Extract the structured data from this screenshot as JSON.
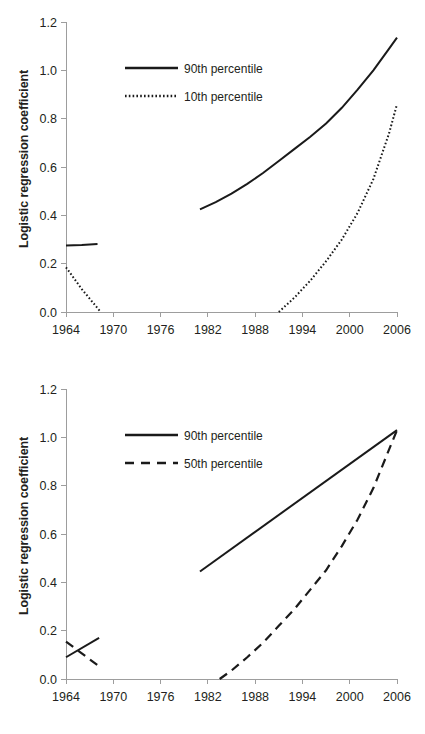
{
  "figure": {
    "background_color": "#ffffff",
    "line_color": "#1a1a1a",
    "axis_color": "#9d9d9d",
    "text_color": "#231f20"
  },
  "panels": [
    {
      "id": "top",
      "ylabel": "Logistic regression coefficient",
      "yticks": [
        "1.2",
        "1.0",
        "0.8",
        "0.6",
        "0.4",
        "0.2",
        "0.0"
      ],
      "xticks": [
        "1964",
        "1970",
        "1976",
        "1982",
        "1988",
        "1994",
        "2000",
        "2006"
      ],
      "legend": [
        {
          "label": "90th percentile",
          "style": "solid"
        },
        {
          "label": "10th percentile",
          "style": "dotted"
        }
      ]
    },
    {
      "id": "bottom",
      "ylabel": "Logistic regression coefficient",
      "yticks": [
        "1.2",
        "1.0",
        "0.8",
        "0.6",
        "0.4",
        "0.2",
        "0.0"
      ],
      "xticks": [
        "1964",
        "1970",
        "1976",
        "1982",
        "1988",
        "1994",
        "2000",
        "2006"
      ],
      "legend": [
        {
          "label": "90th percentile",
          "style": "solid"
        },
        {
          "label": "50th percentile",
          "style": "dashed"
        }
      ]
    }
  ],
  "chart_data": [
    {
      "type": "line",
      "title": "",
      "xlabel": "",
      "ylabel": "Logistic regression coefficient",
      "xlim": [
        1964,
        2006
      ],
      "ylim": [
        0.0,
        1.2
      ],
      "xticks": [
        1964,
        1970,
        1976,
        1982,
        1988,
        1994,
        2000,
        2006
      ],
      "yticks": [
        0.0,
        0.2,
        0.4,
        0.6,
        0.8,
        1.0,
        1.2
      ],
      "grid": false,
      "legend_position": "upper-left-inside",
      "series": [
        {
          "name": "90th percentile",
          "style": "solid",
          "segments": [
            {
              "x": [
                1964,
                1965,
                1966,
                1967,
                1968
              ],
              "y": [
                0.275,
                0.276,
                0.277,
                0.279,
                0.281
              ]
            },
            {
              "x": [
                1981,
                1983,
                1985,
                1987,
                1989,
                1991,
                1993,
                1995,
                1997,
                1999,
                2001,
                2003,
                2005,
                2006
              ],
              "y": [
                0.425,
                0.455,
                0.49,
                0.53,
                0.575,
                0.625,
                0.675,
                0.725,
                0.78,
                0.845,
                0.92,
                1.0,
                1.09,
                1.135
              ]
            }
          ]
        },
        {
          "name": "10th percentile",
          "style": "dotted",
          "segments": [
            {
              "x": [
                1964,
                1966,
                1968.4
              ],
              "y": [
                0.185,
                0.095,
                0.0
              ]
            },
            {
              "x": [
                1991,
                1993,
                1995,
                1997,
                1999,
                2001,
                2003,
                2005,
                2006
              ],
              "y": [
                0.0,
                0.06,
                0.13,
                0.21,
                0.3,
                0.41,
                0.55,
                0.74,
                0.86
              ]
            }
          ]
        }
      ]
    },
    {
      "type": "line",
      "title": "",
      "xlabel": "",
      "ylabel": "Logistic regression coefficient",
      "xlim": [
        1964,
        2006
      ],
      "ylim": [
        0.0,
        1.2
      ],
      "xticks": [
        1964,
        1970,
        1976,
        1982,
        1988,
        1994,
        2000,
        2006
      ],
      "yticks": [
        0.0,
        0.2,
        0.4,
        0.6,
        0.8,
        1.0,
        1.2
      ],
      "grid": false,
      "legend_position": "upper-left-inside",
      "series": [
        {
          "name": "90th percentile",
          "style": "solid",
          "segments": [
            {
              "x": [
                1964,
                1968.2
              ],
              "y": [
                0.09,
                0.17
              ]
            },
            {
              "x": [
                1981,
                2006
              ],
              "y": [
                0.445,
                1.03
              ]
            }
          ]
        },
        {
          "name": "50th percentile",
          "style": "dashed",
          "segments": [
            {
              "x": [
                1964,
                1968.5
              ],
              "y": [
                0.155,
                0.045
              ]
            },
            {
              "x": [
                1983.5,
                1985,
                1987,
                1989,
                1991,
                1993,
                1995,
                1997,
                1999,
                2001,
                2003,
                2005,
                2006
              ],
              "y": [
                0.0,
                0.035,
                0.09,
                0.15,
                0.22,
                0.29,
                0.37,
                0.45,
                0.55,
                0.66,
                0.79,
                0.95,
                1.03
              ]
            }
          ]
        }
      ]
    }
  ]
}
